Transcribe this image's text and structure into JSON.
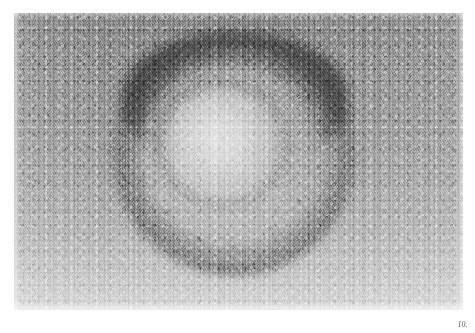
{
  "page": {
    "background_color": "#ffffff",
    "width": 475,
    "height": 333,
    "medium": "halftone-printed-plate"
  },
  "figure": {
    "number_label": "10.",
    "caption_position": "bottom-right",
    "caption_style": "italic-serif"
  },
  "micrograph": {
    "type": "transmission-electron-micrograph",
    "rendering": "grayscale",
    "frame": {
      "left": 14,
      "top": 13,
      "width": 449,
      "height": 297
    },
    "background_tone": "#9c9c9c",
    "grain": "heavy-photographic-halftone-grain",
    "tonal_gradient": "darker at top, lighter toward bottom",
    "subject": {
      "name": "virus-particle",
      "shape": "roughly circular / icosahedral",
      "center_x": 228,
      "center_y": 155,
      "radius": 95,
      "features": [
        "dark diffuse halo surrounding particle",
        "very dark band across top of halo",
        "dark capsid rim annulus",
        "granular capsomere speckle across surface",
        "bright nucleocapsid core slightly above-left of center"
      ],
      "halo_color": "#2a2a2a",
      "rim_color": "#3d3d3d",
      "core_highlight_color": "#e4e4e4"
    }
  }
}
